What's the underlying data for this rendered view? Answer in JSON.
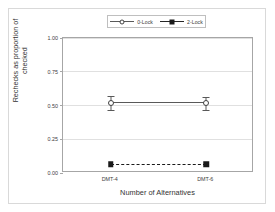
{
  "chart_data": {
    "type": "line",
    "title": "",
    "xlabel": "Number of Alternatives",
    "ylabel_line1": "Rechecks as proportion of",
    "ylabel_line2": "checked",
    "categories": [
      "DMT-4",
      "DMT-6"
    ],
    "ylim": [
      0.0,
      1.0
    ],
    "yticks": [
      "0.00",
      "0.25",
      "0.50",
      "0.75",
      "1.00"
    ],
    "ytick_values": [
      0.0,
      0.25,
      0.5,
      0.75,
      1.0
    ],
    "grid": true,
    "legend_position": "top-center",
    "series": [
      {
        "name": "0-Lock",
        "marker": "open-circle",
        "linestyle": "solid",
        "color": "#595959",
        "values": [
          0.52,
          0.515
        ],
        "errors": [
          0.05,
          0.05
        ]
      },
      {
        "name": "2-Lock",
        "marker": "filled-square",
        "linestyle": "dashed",
        "color": "#1a1a1a",
        "values": [
          0.065,
          0.065
        ],
        "errors": [
          0.0,
          0.0
        ]
      }
    ]
  },
  "legend": {
    "items": [
      {
        "label": "0-Lock"
      },
      {
        "label": "2-Lock"
      }
    ]
  },
  "axes": {
    "x_title": "Number of Alternatives",
    "y_title_line1": "Rechecks as proportion of",
    "y_title_line2": "checked"
  }
}
